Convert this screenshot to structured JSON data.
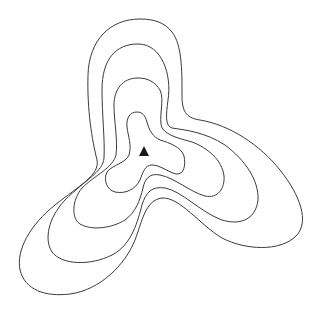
{
  "diagram": {
    "type": "topographic-contour-map",
    "contour_count": 4,
    "line_color": "#3a3a3a",
    "marker_color": "#1a1a1a",
    "background": "#ffffff",
    "summit": {
      "symbol": "triangle",
      "x": 144,
      "y": 151
    },
    "contours": [
      {
        "level": 1,
        "name": "outer"
      },
      {
        "level": 2,
        "name": "second"
      },
      {
        "level": 3,
        "name": "third"
      },
      {
        "level": 4,
        "name": "inner"
      }
    ]
  }
}
